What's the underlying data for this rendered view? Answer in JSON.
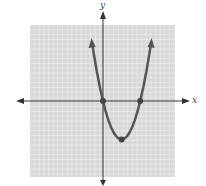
{
  "chart_data": {
    "type": "line",
    "title": "",
    "xlabel": "x",
    "ylabel": "y",
    "function": "y = x^2 - 4x",
    "xlim": [
      -8,
      8
    ],
    "ylim": [
      -8,
      8
    ],
    "grid": true,
    "legend": null,
    "series": [
      {
        "name": "parabola",
        "x": [
          -0.9,
          0,
          1,
          2,
          3,
          4,
          4.9
        ],
        "values": [
          4.41,
          0,
          -3,
          -4,
          -3,
          0,
          4.41
        ]
      }
    ],
    "marked_points": [
      {
        "x": 0,
        "y": 0,
        "label": "x-intercept"
      },
      {
        "x": 4,
        "y": 0,
        "label": "x-intercept"
      },
      {
        "x": 2,
        "y": -4,
        "label": "vertex"
      }
    ]
  },
  "labels": {
    "x_axis": "x",
    "y_axis": "y"
  },
  "colors": {
    "grid_bg": "#d8d8d8",
    "grid_line": "#f2f2f2",
    "axis": "#333333",
    "curve": "#555555"
  }
}
